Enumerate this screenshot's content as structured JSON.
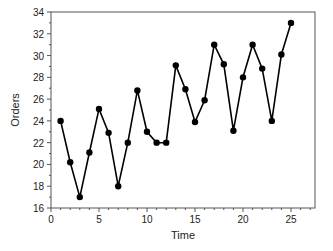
{
  "chart_data": {
    "type": "line",
    "title": "",
    "xlabel": "Time",
    "ylabel": "Orders",
    "xlim": [
      0,
      27.5
    ],
    "ylim": [
      16,
      34
    ],
    "x_ticks": [
      0,
      5,
      10,
      15,
      20,
      25
    ],
    "y_ticks": [
      16,
      18,
      20,
      22,
      24,
      26,
      28,
      30,
      32,
      34
    ],
    "grid": false,
    "legend": null,
    "markers": "filled-circle",
    "series": [
      {
        "name": "Orders",
        "color": "#000000",
        "x": [
          1,
          2,
          3,
          4,
          5,
          6,
          7,
          8,
          9,
          10,
          11,
          12,
          13,
          14,
          15,
          16,
          17,
          18,
          19,
          20,
          21,
          22,
          23,
          24,
          25
        ],
        "values": [
          24,
          20.2,
          17,
          21.1,
          25.1,
          22.9,
          18,
          22,
          26.8,
          23,
          22,
          22,
          29.1,
          26.9,
          23.9,
          25.9,
          31,
          29.2,
          23.1,
          28,
          31,
          28.8,
          24,
          30.1,
          33
        ]
      }
    ]
  }
}
